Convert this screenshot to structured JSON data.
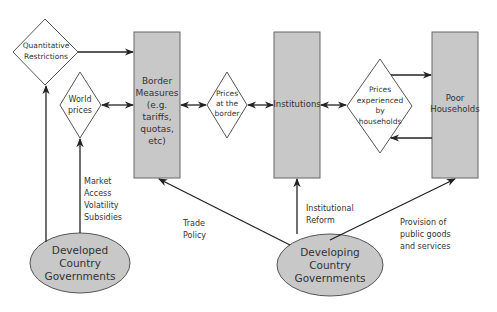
{
  "diagram": {
    "nodes": {
      "quantitative_restrictions": {
        "label_line1": "Quantitative",
        "label_line2": "Restrictions",
        "shape": "diamond"
      },
      "world_prices": {
        "label_line1": "World",
        "label_line2": "prices",
        "shape": "diamond"
      },
      "border_measures": {
        "lines": [
          "Border",
          "Measures",
          "(e.g.",
          "tariffs,",
          "quotas,",
          "etc)"
        ],
        "shape": "box"
      },
      "prices_at_border": {
        "lines": [
          "Prices",
          "at the",
          "border"
        ],
        "shape": "diamond"
      },
      "institutions": {
        "label": "Institutions",
        "shape": "box"
      },
      "prices_experienced": {
        "lines": [
          "Prices",
          "experienced",
          "by",
          "households"
        ],
        "shape": "diamond"
      },
      "poor_households": {
        "lines": [
          "Poor",
          "Households"
        ],
        "shape": "box"
      },
      "developed_governments": {
        "lines": [
          "Developed",
          "Country",
          "Governments"
        ],
        "shape": "ellipse"
      },
      "developing_governments": {
        "lines": [
          "Developing",
          "Country",
          "Governments"
        ],
        "shape": "ellipse"
      }
    },
    "edge_labels": {
      "market_access": [
        "Market",
        "Access",
        "Volatility",
        "Subsidies"
      ],
      "trade_policy": [
        "Trade",
        "Policy"
      ],
      "institutional_reform": [
        "Institutional",
        "Reform"
      ],
      "provision": [
        "Provision of",
        "public goods",
        "and services"
      ]
    },
    "colors": {
      "box_fill": "#c8c8c8",
      "ellipse_fill": "#c8c8c8",
      "stroke": "#555555",
      "text": "#333333"
    }
  }
}
